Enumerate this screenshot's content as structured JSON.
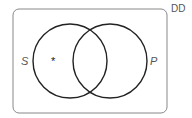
{
  "diagram": {
    "type": "venn",
    "corner_label": "DD",
    "left_set_label": "S",
    "right_set_label": "P",
    "marker": "*",
    "colors": {
      "stroke": "#222222",
      "frame": "#888888",
      "text": "#555555"
    }
  }
}
